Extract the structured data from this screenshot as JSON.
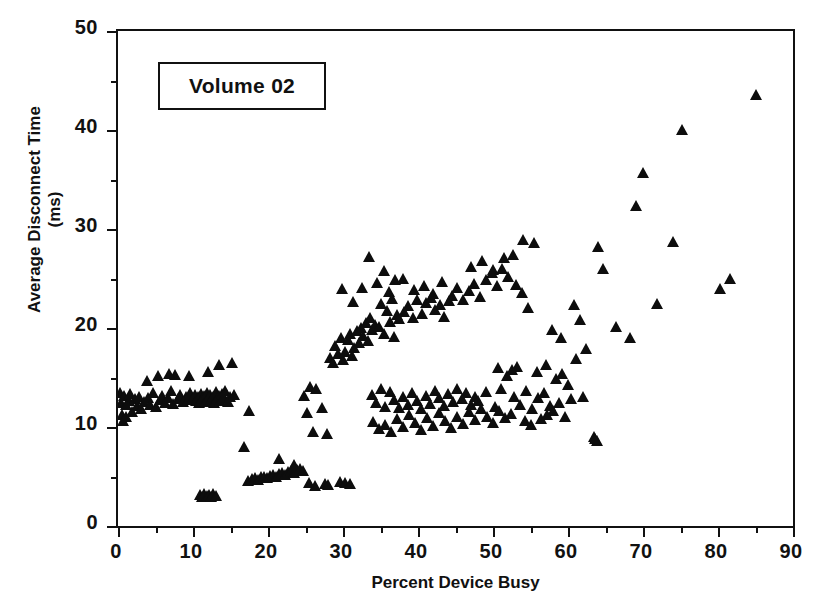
{
  "chart_data": {
    "type": "scatter",
    "title": "",
    "annotation": "Volume 02",
    "xlabel": "Percent Device Busy",
    "ylabel": "Average Disconnect Time",
    "ylabel_line2": "(ms)",
    "xlim": [
      0,
      90
    ],
    "ylim": [
      0,
      50
    ],
    "xticks": [
      0,
      10,
      20,
      30,
      40,
      50,
      60,
      70,
      80,
      90
    ],
    "yticks": [
      0,
      10,
      20,
      30,
      40,
      50
    ],
    "x_minor_step": 5,
    "y_minor_step": 5,
    "grid": false,
    "legend": null,
    "marker": "triangle-up",
    "marker_color": "#0d0d0d",
    "frame_color": "#111111",
    "series": [
      {
        "name": "Volume 02",
        "points": [
          [
            0.3,
            13.4
          ],
          [
            0.4,
            12.4
          ],
          [
            0.5,
            11.2
          ],
          [
            0.6,
            10.6
          ],
          [
            0.8,
            13.1
          ],
          [
            1.0,
            12.2
          ],
          [
            1.1,
            11.0
          ],
          [
            1.4,
            12.6
          ],
          [
            1.6,
            13.3
          ],
          [
            1.9,
            11.5
          ],
          [
            2.2,
            12.8
          ],
          [
            2.5,
            12.1
          ],
          [
            2.8,
            13.0
          ],
          [
            3.1,
            11.8
          ],
          [
            3.4,
            12.5
          ],
          [
            3.8,
            14.6
          ],
          [
            4.0,
            12.9
          ],
          [
            4.3,
            12.2
          ],
          [
            4.6,
            13.4
          ],
          [
            5.0,
            12.0
          ],
          [
            5.3,
            15.2
          ],
          [
            5.6,
            12.7
          ],
          [
            5.9,
            13.1
          ],
          [
            6.2,
            12.4
          ],
          [
            6.6,
            12.9
          ],
          [
            7.0,
            13.6
          ],
          [
            7.3,
            12.3
          ],
          [
            7.6,
            15.3
          ],
          [
            8.0,
            12.8
          ],
          [
            8.3,
            13.2
          ],
          [
            8.6,
            12.5
          ],
          [
            9.0,
            13.0
          ],
          [
            9.3,
            12.7
          ],
          [
            9.6,
            13.4
          ],
          [
            10.0,
            12.9
          ],
          [
            10.2,
            13.2
          ],
          [
            10.4,
            12.6
          ],
          [
            10.6,
            13.0
          ],
          [
            10.8,
            12.4
          ],
          [
            11.0,
            13.3
          ],
          [
            11.2,
            12.8
          ],
          [
            11.4,
            13.1
          ],
          [
            11.6,
            12.5
          ],
          [
            11.8,
            13.4
          ],
          [
            12.0,
            12.9
          ],
          [
            12.2,
            13.2
          ],
          [
            12.4,
            12.7
          ],
          [
            12.6,
            13.0
          ],
          [
            12.8,
            12.4
          ],
          [
            13.0,
            13.5
          ],
          [
            13.2,
            12.8
          ],
          [
            13.4,
            13.1
          ],
          [
            13.6,
            12.6
          ],
          [
            13.8,
            13.3
          ],
          [
            14.0,
            12.9
          ],
          [
            14.3,
            13.6
          ],
          [
            14.6,
            12.5
          ],
          [
            14.9,
            13.0
          ],
          [
            15.2,
            16.5
          ],
          [
            15.5,
            13.2
          ],
          [
            13.5,
            16.3
          ],
          [
            12.0,
            15.6
          ],
          [
            9.5,
            15.2
          ],
          [
            6.8,
            15.4
          ],
          [
            10.9,
            3.1
          ],
          [
            11.2,
            2.9
          ],
          [
            11.5,
            3.2
          ],
          [
            11.8,
            3.0
          ],
          [
            12.1,
            3.1
          ],
          [
            12.4,
            2.9
          ],
          [
            12.7,
            3.2
          ],
          [
            13.0,
            3.0
          ],
          [
            16.8,
            8.0
          ],
          [
            17.5,
            11.6
          ],
          [
            17.3,
            4.5
          ],
          [
            17.8,
            4.7
          ],
          [
            18.2,
            4.8
          ],
          [
            18.6,
            4.6
          ],
          [
            19.0,
            4.9
          ],
          [
            19.4,
            5.0
          ],
          [
            19.8,
            4.8
          ],
          [
            20.2,
            5.1
          ],
          [
            20.6,
            5.2
          ],
          [
            21.0,
            5.0
          ],
          [
            21.4,
            5.3
          ],
          [
            21.8,
            5.4
          ],
          [
            22.2,
            5.2
          ],
          [
            22.6,
            5.5
          ],
          [
            23.0,
            5.6
          ],
          [
            23.4,
            5.4
          ],
          [
            23.8,
            5.7
          ],
          [
            24.2,
            5.8
          ],
          [
            24.6,
            5.6
          ],
          [
            21.5,
            6.8
          ],
          [
            23.5,
            6.2
          ],
          [
            25.4,
            4.3
          ],
          [
            26.2,
            4.0
          ],
          [
            27.6,
            4.2
          ],
          [
            28.0,
            4.1
          ],
          [
            29.6,
            4.4
          ],
          [
            30.2,
            4.3
          ],
          [
            30.9,
            4.2
          ],
          [
            24.8,
            13.1
          ],
          [
            25.6,
            14.0
          ],
          [
            26.4,
            13.8
          ],
          [
            25.2,
            11.4
          ],
          [
            27.2,
            11.9
          ],
          [
            26.0,
            9.5
          ],
          [
            27.9,
            9.3
          ],
          [
            28.2,
            17.0
          ],
          [
            28.6,
            16.5
          ],
          [
            28.9,
            18.2
          ],
          [
            29.3,
            17.4
          ],
          [
            29.7,
            19.0
          ],
          [
            30.0,
            16.8
          ],
          [
            30.3,
            17.6
          ],
          [
            30.6,
            18.8
          ],
          [
            30.9,
            19.4
          ],
          [
            31.2,
            17.2
          ],
          [
            31.5,
            18.0
          ],
          [
            31.8,
            19.7
          ],
          [
            32.1,
            18.5
          ],
          [
            32.4,
            20.0
          ],
          [
            32.7,
            19.2
          ],
          [
            33.0,
            20.5
          ],
          [
            33.3,
            18.7
          ],
          [
            33.6,
            21.0
          ],
          [
            33.9,
            19.8
          ],
          [
            34.2,
            20.3
          ],
          [
            29.8,
            23.9
          ],
          [
            31.3,
            22.6
          ],
          [
            32.5,
            24.0
          ],
          [
            33.5,
            27.2
          ],
          [
            34.5,
            24.5
          ],
          [
            35.4,
            25.8
          ],
          [
            36.1,
            23.6
          ],
          [
            36.9,
            24.8
          ],
          [
            35.0,
            22.4
          ],
          [
            35.8,
            21.7
          ],
          [
            36.5,
            22.9
          ],
          [
            37.2,
            21.3
          ],
          [
            34.8,
            20.1
          ],
          [
            35.5,
            19.4
          ],
          [
            36.2,
            20.6
          ],
          [
            36.8,
            19.1
          ],
          [
            37.5,
            20.9
          ],
          [
            38.1,
            21.6
          ],
          [
            38.7,
            22.2
          ],
          [
            39.3,
            21.0
          ],
          [
            39.9,
            22.8
          ],
          [
            40.5,
            21.4
          ],
          [
            41.1,
            22.5
          ],
          [
            41.7,
            23.0
          ],
          [
            42.3,
            21.8
          ],
          [
            42.9,
            22.3
          ],
          [
            43.5,
            21.1
          ],
          [
            44.1,
            22.7
          ],
          [
            38.0,
            24.9
          ],
          [
            39.5,
            23.8
          ],
          [
            40.8,
            24.2
          ],
          [
            42.0,
            23.4
          ],
          [
            43.2,
            24.6
          ],
          [
            44.5,
            23.2
          ],
          [
            45.2,
            24.0
          ],
          [
            46.0,
            22.8
          ],
          [
            46.8,
            23.7
          ],
          [
            47.5,
            24.4
          ],
          [
            48.2,
            23.1
          ],
          [
            49.0,
            24.8
          ],
          [
            49.8,
            25.6
          ],
          [
            50.5,
            24.2
          ],
          [
            51.2,
            26.0
          ],
          [
            52.0,
            25.2
          ],
          [
            47.0,
            26.2
          ],
          [
            48.5,
            26.8
          ],
          [
            50.0,
            25.9
          ],
          [
            51.5,
            27.1
          ],
          [
            53.0,
            24.3
          ],
          [
            53.8,
            23.5
          ],
          [
            54.6,
            22.0
          ],
          [
            55.4,
            28.6
          ],
          [
            54.0,
            28.9
          ],
          [
            52.6,
            27.4
          ],
          [
            33.8,
            13.2
          ],
          [
            34.4,
            12.4
          ],
          [
            35.0,
            13.8
          ],
          [
            35.6,
            12.0
          ],
          [
            36.2,
            13.5
          ],
          [
            36.8,
            12.7
          ],
          [
            37.4,
            11.9
          ],
          [
            38.0,
            13.0
          ],
          [
            38.6,
            12.2
          ],
          [
            39.2,
            13.4
          ],
          [
            39.8,
            12.6
          ],
          [
            40.4,
            11.8
          ],
          [
            41.0,
            13.1
          ],
          [
            41.6,
            12.3
          ],
          [
            42.2,
            13.6
          ],
          [
            42.8,
            12.9
          ],
          [
            43.4,
            12.1
          ],
          [
            44.0,
            13.3
          ],
          [
            44.6,
            12.5
          ],
          [
            45.2,
            13.8
          ],
          [
            45.8,
            12.8
          ],
          [
            46.4,
            13.4
          ],
          [
            47.0,
            12.2
          ],
          [
            47.6,
            13.0
          ],
          [
            34.0,
            10.5
          ],
          [
            34.8,
            9.8
          ],
          [
            35.6,
            10.2
          ],
          [
            36.4,
            9.5
          ],
          [
            37.2,
            10.8
          ],
          [
            38.0,
            10.0
          ],
          [
            38.8,
            11.2
          ],
          [
            39.6,
            10.4
          ],
          [
            40.4,
            9.7
          ],
          [
            41.2,
            10.9
          ],
          [
            42.0,
            10.1
          ],
          [
            42.8,
            11.4
          ],
          [
            43.6,
            10.6
          ],
          [
            44.4,
            9.9
          ],
          [
            45.2,
            11.0
          ],
          [
            46.0,
            10.3
          ],
          [
            46.8,
            11.5
          ],
          [
            47.6,
            10.7
          ],
          [
            48.4,
            11.8
          ],
          [
            49.2,
            11.0
          ],
          [
            50.0,
            10.4
          ],
          [
            50.8,
            11.6
          ],
          [
            51.6,
            10.9
          ],
          [
            52.4,
            11.3
          ],
          [
            48.0,
            12.6
          ],
          [
            49.0,
            13.5
          ],
          [
            50.2,
            12.0
          ],
          [
            51.0,
            13.8
          ],
          [
            51.8,
            15.2
          ],
          [
            52.5,
            15.8
          ],
          [
            53.2,
            16.1
          ],
          [
            50.6,
            16.0
          ],
          [
            52.8,
            13.0
          ],
          [
            53.6,
            12.2
          ],
          [
            54.4,
            13.6
          ],
          [
            55.2,
            11.8
          ],
          [
            56.0,
            12.9
          ],
          [
            56.8,
            13.4
          ],
          [
            57.6,
            12.1
          ],
          [
            55.8,
            15.6
          ],
          [
            57.0,
            16.3
          ],
          [
            58.4,
            14.8
          ],
          [
            59.2,
            15.4
          ],
          [
            60.0,
            14.2
          ],
          [
            58.0,
            11.6
          ],
          [
            58.8,
            12.4
          ],
          [
            59.6,
            11.0
          ],
          [
            60.4,
            12.8
          ],
          [
            56.4,
            10.8
          ],
          [
            57.2,
            11.2
          ],
          [
            55.0,
            10.2
          ],
          [
            54.2,
            10.6
          ],
          [
            60.8,
            22.3
          ],
          [
            61.6,
            20.8
          ],
          [
            62.4,
            17.9
          ],
          [
            59.0,
            19.0
          ],
          [
            57.8,
            19.8
          ],
          [
            61.0,
            16.9
          ],
          [
            62.0,
            13.0
          ],
          [
            63.4,
            9.0
          ],
          [
            63.8,
            8.6
          ],
          [
            63.6,
            8.8
          ],
          [
            64.0,
            28.2
          ],
          [
            66.4,
            20.1
          ],
          [
            68.2,
            19.0
          ],
          [
            64.6,
            26.0
          ],
          [
            69.0,
            32.3
          ],
          [
            70.0,
            35.7
          ],
          [
            71.8,
            22.4
          ],
          [
            74.0,
            28.7
          ],
          [
            75.2,
            40.0
          ],
          [
            80.2,
            23.9
          ],
          [
            81.6,
            25.0
          ],
          [
            85.0,
            43.5
          ]
        ]
      }
    ]
  }
}
